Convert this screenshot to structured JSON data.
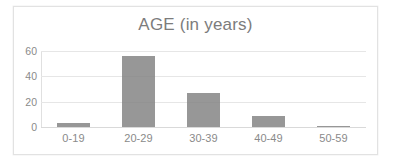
{
  "chart_data": {
    "type": "bar",
    "title": "AGE (in years)",
    "xlabel": "",
    "ylabel": "",
    "categories": [
      "0-19",
      "20-29",
      "30-39",
      "40-49",
      "50-59"
    ],
    "values": [
      3,
      56,
      27,
      9,
      1
    ],
    "ytick_labels": [
      "60",
      "40",
      "20",
      "0"
    ],
    "yticks": [
      60,
      40,
      20,
      0
    ],
    "ylim": [
      0,
      60
    ],
    "grid": true,
    "legend": false,
    "legend_position": "none",
    "series": [
      {
        "name": "AGE (in years)",
        "values": [
          3,
          56,
          27,
          9,
          1
        ]
      }
    ],
    "colors": {
      "bar": "#808080",
      "gridline": "#e6e6e6",
      "axis": "#e0e0e0",
      "text": "#8a8a8a",
      "title_text": "#7c7c7c",
      "background": "#ffffff",
      "frame_border": "#e2e2e2"
    }
  }
}
